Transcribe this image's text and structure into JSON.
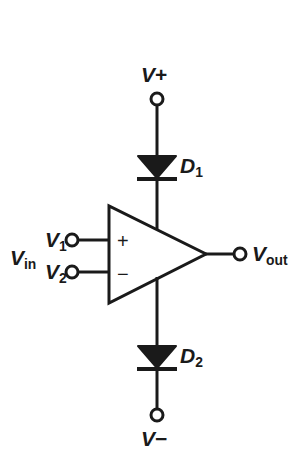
{
  "diagram": {
    "type": "schematic",
    "background_color": "#ffffff",
    "line_color": "#1a1a1a",
    "fill_color": "#1a1a1a"
  },
  "labels": {
    "v_plus": "V",
    "v_plus_sign": "+",
    "v_minus": "V",
    "v_minus_sign": "−",
    "d1_name": "D",
    "d1_index": "1",
    "d2_name": "D",
    "d2_index": "2",
    "v_in": "V",
    "v_in_sub": "in",
    "v1": "V",
    "v1_sub": "1",
    "v2": "V",
    "v2_sub": "2",
    "v_out": "V",
    "v_out_sub": "out",
    "noninverting_sign": "+",
    "inverting_sign": "−"
  },
  "components": [
    {
      "id": "opamp",
      "name": "operational-amplifier",
      "shape": "triangle",
      "apex_x": 206,
      "apex_y": 254,
      "left_x": 109,
      "top_y": 206,
      "bottom_y": 303
    },
    {
      "id": "d1",
      "name": "diode-d1",
      "orientation": "cathode-down",
      "anode_y": 157,
      "cathode_y": 178,
      "center_x": 157
    },
    {
      "id": "d2",
      "name": "diode-d2",
      "orientation": "cathode-down",
      "anode_y": 347,
      "cathode_y": 368,
      "center_x": 157
    }
  ],
  "terminals": [
    {
      "id": "v-plus-terminal",
      "x": 157,
      "y": 99,
      "r": 6
    },
    {
      "id": "v-minus-terminal",
      "x": 157,
      "y": 415,
      "r": 6
    },
    {
      "id": "v1-terminal",
      "x": 72,
      "y": 240,
      "r": 6
    },
    {
      "id": "v2-terminal",
      "x": 72,
      "y": 272,
      "r": 6
    },
    {
      "id": "vout-terminal",
      "x": 240,
      "y": 254,
      "r": 6
    }
  ],
  "wires": [
    {
      "id": "wire-vplus-to-d1",
      "points": "157,105 157,157"
    },
    {
      "id": "wire-d1-to-opamp",
      "points": "157,178 157,230"
    },
    {
      "id": "wire-opamp-to-d2",
      "points": "157,279 157,347"
    },
    {
      "id": "wire-d2-to-vminus",
      "points": "157,368 157,409"
    },
    {
      "id": "wire-v1-to-opamp",
      "points": "78,240 109,240"
    },
    {
      "id": "wire-v2-to-opamp",
      "points": "78,272 109,272"
    },
    {
      "id": "wire-opamp-to-vout",
      "points": "206,254 234,254"
    }
  ]
}
